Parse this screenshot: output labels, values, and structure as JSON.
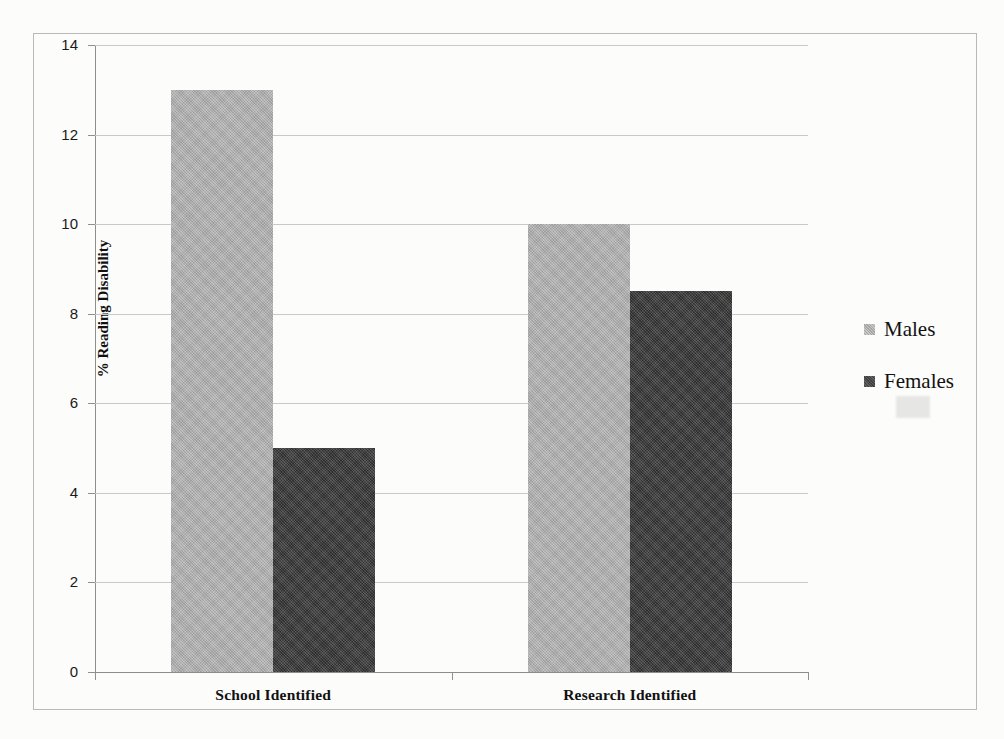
{
  "chart_data": {
    "type": "bar",
    "title": "",
    "xlabel": "",
    "ylabel": "% Reading Disability",
    "ylim": [
      0,
      14
    ],
    "ytick_step": 2,
    "ytick_labels": [
      "14",
      "12",
      "10",
      "8",
      "6",
      "4",
      "2",
      "0"
    ],
    "ytick_values": [
      14,
      12,
      10,
      8,
      6,
      4,
      2,
      0
    ],
    "grid": true,
    "legend_position": "right",
    "categories": [
      "School Identified",
      "Research  Identified"
    ],
    "series": [
      {
        "name": "Males",
        "values": [
          13.0,
          10.0
        ],
        "color": "#adadad"
      },
      {
        "name": "Females",
        "values": [
          5.0,
          8.5
        ],
        "color": "#3a3a3a"
      }
    ]
  },
  "legend": {
    "items": [
      {
        "label": "Males",
        "swatch": "legend-swatch-males"
      },
      {
        "label": "Females",
        "swatch": "legend-swatch-females"
      }
    ]
  },
  "axis": {
    "y_title": "% Reading Disability",
    "y_labels": [
      "14",
      "12",
      "10",
      "8",
      "6",
      "4",
      "2",
      "0"
    ]
  },
  "categories": [
    {
      "label": "School Identified"
    },
    {
      "label": "Research  Identified"
    }
  ],
  "colors": {
    "males": "#adadad",
    "females": "#3a3a3a",
    "grid": "#c9c9c9",
    "axis": "#8f8f8f",
    "frame": "#b9b9b9",
    "background": "#fdfdfc"
  }
}
